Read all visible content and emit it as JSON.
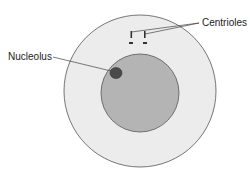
{
  "diagram": {
    "type": "cell-structure",
    "labels": {
      "centrioles": "Centrioles",
      "nucleolus": "Nucleolus"
    },
    "colors": {
      "cytoplasm": "#ececec",
      "nucleus": "#b4b4b4",
      "nucleolus": "#4a4a4a",
      "outline": "#555555",
      "centriole": "#333333"
    }
  }
}
